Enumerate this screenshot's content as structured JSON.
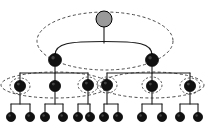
{
  "figure": {
    "width": 205,
    "height": 126,
    "background_color": "#ffffff"
  },
  "colors": {
    "node_fill_dark": "#111111",
    "node_fill_root": "#9a9a9a",
    "node_stroke": "#000000",
    "edge_stroke": "#1a1a1a",
    "cluster_stroke": "#4a4a4a",
    "highlight_ring": "#111111"
  },
  "chart_data": {
    "type": "diagram",
    "subtype": "tree-graph",
    "title": "",
    "levels": 4,
    "node_counts_per_level": [
      1,
      2,
      6,
      12
    ],
    "total_nodes": 21,
    "nodes": [
      {
        "id": "n0",
        "level": 0,
        "x": 104,
        "y": 19,
        "r": 8.0,
        "fill": "root",
        "label": ""
      },
      {
        "id": "n1",
        "level": 1,
        "x": 55,
        "y": 60,
        "r": 6.5,
        "fill": "dark",
        "label": ""
      },
      {
        "id": "n2",
        "level": 1,
        "x": 152,
        "y": 60,
        "r": 6.5,
        "fill": "dark",
        "label": ""
      },
      {
        "id": "n3",
        "level": 2,
        "x": 20,
        "y": 86,
        "r": 5.6,
        "fill": "dark",
        "label": ""
      },
      {
        "id": "n4",
        "level": 2,
        "x": 55,
        "y": 86,
        "r": 5.6,
        "fill": "dark",
        "label": ""
      },
      {
        "id": "n5",
        "level": 2,
        "x": 88,
        "y": 85,
        "r": 5.6,
        "fill": "dark",
        "label": ""
      },
      {
        "id": "n6",
        "level": 2,
        "x": 107,
        "y": 85,
        "r": 5.6,
        "fill": "dark",
        "label": ""
      },
      {
        "id": "n7",
        "level": 2,
        "x": 152,
        "y": 86,
        "r": 5.6,
        "fill": "dark",
        "label": ""
      },
      {
        "id": "n8",
        "level": 2,
        "x": 190,
        "y": 86,
        "r": 5.6,
        "fill": "dark",
        "label": ""
      },
      {
        "id": "n9",
        "level": 3,
        "x": 11,
        "y": 117,
        "r": 4.6,
        "fill": "dark",
        "label": ""
      },
      {
        "id": "n10",
        "level": 3,
        "x": 30,
        "y": 117,
        "r": 4.6,
        "fill": "dark",
        "label": ""
      },
      {
        "id": "n11",
        "level": 3,
        "x": 45,
        "y": 117,
        "r": 4.6,
        "fill": "dark",
        "label": ""
      },
      {
        "id": "n12",
        "level": 3,
        "x": 63,
        "y": 117,
        "r": 4.6,
        "fill": "dark",
        "label": ""
      },
      {
        "id": "n13",
        "level": 3,
        "x": 78,
        "y": 117,
        "r": 4.6,
        "fill": "dark",
        "label": ""
      },
      {
        "id": "n14",
        "level": 3,
        "x": 90,
        "y": 117,
        "r": 4.6,
        "fill": "dark",
        "label": ""
      },
      {
        "id": "n15",
        "level": 3,
        "x": 104,
        "y": 117,
        "r": 4.6,
        "fill": "dark",
        "label": ""
      },
      {
        "id": "n16",
        "level": 3,
        "x": 118,
        "y": 117,
        "r": 4.6,
        "fill": "dark",
        "label": ""
      },
      {
        "id": "n17",
        "level": 3,
        "x": 142,
        "y": 117,
        "r": 4.6,
        "fill": "dark",
        "label": ""
      },
      {
        "id": "n18",
        "level": 3,
        "x": 162,
        "y": 117,
        "r": 4.6,
        "fill": "dark",
        "label": ""
      },
      {
        "id": "n19",
        "level": 3,
        "x": 180,
        "y": 117,
        "r": 4.6,
        "fill": "dark",
        "label": ""
      },
      {
        "id": "n20",
        "level": 3,
        "x": 198,
        "y": 117,
        "r": 4.6,
        "fill": "dark",
        "label": ""
      }
    ],
    "edges": [
      {
        "from": "n0",
        "to": "n1",
        "style": "curved-bus"
      },
      {
        "from": "n0",
        "to": "n2",
        "style": "curved-bus"
      },
      {
        "from": "n1",
        "to": "n3",
        "style": "orthogonal"
      },
      {
        "from": "n1",
        "to": "n4",
        "style": "orthogonal"
      },
      {
        "from": "n1",
        "to": "n5",
        "style": "orthogonal"
      },
      {
        "from": "n2",
        "to": "n6",
        "style": "orthogonal"
      },
      {
        "from": "n2",
        "to": "n7",
        "style": "orthogonal"
      },
      {
        "from": "n2",
        "to": "n8",
        "style": "orthogonal"
      },
      {
        "from": "n3",
        "to": "n9",
        "style": "orthogonal"
      },
      {
        "from": "n3",
        "to": "n10",
        "style": "orthogonal"
      },
      {
        "from": "n4",
        "to": "n11",
        "style": "orthogonal"
      },
      {
        "from": "n4",
        "to": "n12",
        "style": "orthogonal"
      },
      {
        "from": "n5",
        "to": "n13",
        "style": "orthogonal"
      },
      {
        "from": "n5",
        "to": "n14",
        "style": "orthogonal"
      },
      {
        "from": "n6",
        "to": "n15",
        "style": "orthogonal"
      },
      {
        "from": "n6",
        "to": "n16",
        "style": "orthogonal"
      },
      {
        "from": "n7",
        "to": "n17",
        "style": "orthogonal"
      },
      {
        "from": "n7",
        "to": "n18",
        "style": "orthogonal"
      },
      {
        "from": "n8",
        "to": "n19",
        "style": "orthogonal"
      },
      {
        "from": "n8",
        "to": "n20",
        "style": "orthogonal"
      }
    ],
    "clusters": [
      {
        "id": "c-top",
        "kind": "dashed-ellipse",
        "cx": 105,
        "cy": 41,
        "rx": 68,
        "ry": 29,
        "contains": [
          "n0",
          "n1",
          "n2"
        ]
      },
      {
        "id": "c-left-band",
        "kind": "dashed-ellipse",
        "cx": 55,
        "cy": 85,
        "rx": 54,
        "ry": 13,
        "contains": [
          "n3",
          "n4",
          "n5"
        ]
      },
      {
        "id": "c-right-band",
        "kind": "dashed-ellipse",
        "cx": 152,
        "cy": 85,
        "rx": 52,
        "ry": 13,
        "contains": [
          "n6",
          "n7",
          "n8"
        ]
      },
      {
        "id": "c-n3",
        "kind": "dashed-ellipse-small",
        "cx": 20,
        "cy": 86,
        "rx": 10,
        "ry": 8,
        "contains": [
          "n3"
        ]
      },
      {
        "id": "c-n5",
        "kind": "dashed-ellipse-small",
        "cx": 88,
        "cy": 85,
        "rx": 10,
        "ry": 8,
        "contains": [
          "n5"
        ]
      },
      {
        "id": "c-n6",
        "kind": "dashed-ellipse-small",
        "cx": 107,
        "cy": 85,
        "rx": 10,
        "ry": 8,
        "contains": [
          "n6"
        ]
      },
      {
        "id": "c-n7",
        "kind": "dashed-ellipse-small",
        "cx": 152,
        "cy": 85,
        "rx": 10,
        "ry": 8,
        "contains": [
          "n7"
        ]
      },
      {
        "id": "c-n8",
        "kind": "dashed-ellipse-small",
        "cx": 190,
        "cy": 86,
        "rx": 10,
        "ry": 8,
        "contains": [
          "n8"
        ]
      }
    ],
    "annotations": [],
    "legend": [],
    "grid": false
  }
}
